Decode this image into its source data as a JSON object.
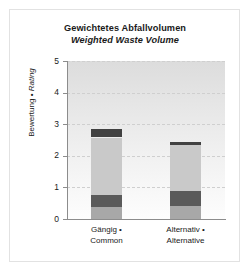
{
  "chart_data": {
    "type": "bar",
    "subtype": "stacked",
    "title": "Gewichtetes Abfallvolumen",
    "subtitle": "Weighted Waste Volume",
    "ylabel_de": "Bewertung",
    "ylabel_sep": " • ",
    "ylabel_en": "Rating",
    "xlabel": "",
    "ylim": [
      0,
      5
    ],
    "yticks": [
      0,
      1,
      2,
      3,
      4,
      5
    ],
    "ytick_labels": [
      "0",
      "1",
      "2",
      "3",
      "4",
      "5"
    ],
    "grid": true,
    "grid_style": "dashed",
    "legend": "none",
    "categories": [
      {
        "line1": "Gängig •",
        "line2": "Common"
      },
      {
        "line1": "Alternativ •",
        "line2": "Alternative"
      }
    ],
    "series": [
      {
        "name": "segment-1",
        "color": "#a8a8a8",
        "values": [
          0.37,
          0.4
        ]
      },
      {
        "name": "segment-2",
        "color": "#5a5a5a",
        "values": [
          0.38,
          0.48
        ]
      },
      {
        "name": "segment-3",
        "color": "#c9c9c9",
        "values": [
          1.83,
          1.45
        ]
      },
      {
        "name": "segment-4",
        "color": "#414141",
        "values": [
          0.27,
          0.11
        ]
      }
    ],
    "totals": [
      2.85,
      2.44
    ],
    "colors": {
      "plot_background_top": "#dcdcdc",
      "plot_background_bottom": "#fdfdfd",
      "axis": "#8c8c8c",
      "grid": "#cfcfcf",
      "text": "#1a1a1a",
      "frame": "#e2e2e2"
    }
  }
}
